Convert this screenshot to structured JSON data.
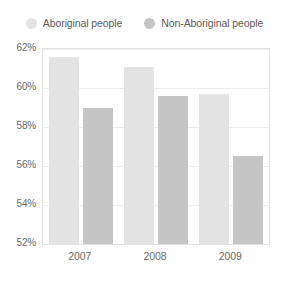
{
  "chart_data": {
    "type": "bar",
    "title": "",
    "subtitle": "",
    "xlabel": "",
    "ylabel": "",
    "categories": [
      "2007",
      "2008",
      "2009"
    ],
    "series": [
      {
        "name": "Aboriginal people",
        "values": [
          61.6,
          61.1,
          59.7
        ],
        "color": "#e3e3e3",
        "legend_marker": "circle"
      },
      {
        "name": "Non-Aboriginal people",
        "values": [
          59.0,
          59.6,
          56.5
        ],
        "color": "#c5c5c5",
        "legend_marker": "circle"
      }
    ],
    "ylim": [
      52,
      62
    ],
    "y_ticks": [
      52,
      54,
      56,
      58,
      60,
      62
    ],
    "y_tick_labels": [
      "52%",
      "54%",
      "56%",
      "58%",
      "60%",
      "62%"
    ],
    "value_suffix": "%",
    "grid": true,
    "grid_axis": "y",
    "legend_position": "top-center",
    "plot_border_color": "#e4e4e4",
    "gridline_color": "#ececec",
    "background_color": "#ffffff",
    "text_color": "#6a6a6a"
  }
}
